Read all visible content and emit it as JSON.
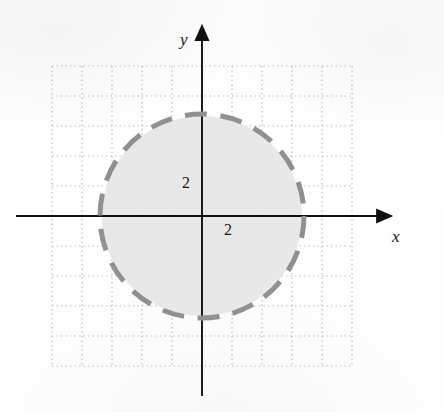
{
  "figure": {
    "background_color": "#fdfdfd"
  },
  "axes": {
    "x_label": "x",
    "y_label": "y",
    "axis_color": "#111111",
    "arrowheads": [
      "x-positive",
      "y-positive"
    ],
    "origin_px": {
      "x": 202,
      "y": 216
    }
  },
  "ticks": {
    "y_tick_label": "2",
    "x_tick_label": "2"
  },
  "grid": {
    "style": "dotted",
    "color": "#b9b9b9",
    "spacing_px": 30,
    "x_min_px": 52,
    "x_max_px": 352,
    "y_min_px": 66,
    "y_max_px": 366,
    "vertical_lines": 11,
    "horizontal_lines": 11
  },
  "chart_data": {
    "type": "scatter",
    "xlabel": "x",
    "ylabel": "y",
    "xlim": [
      -5,
      5
    ],
    "ylim": [
      -5,
      5
    ],
    "x_tick_labels": [
      "2"
    ],
    "y_tick_labels": [
      "2"
    ],
    "grid": true,
    "legend": "none",
    "annotations": [
      {
        "text": "2",
        "x": 0,
        "y": 2,
        "placement": "left-of-y-axis"
      },
      {
        "text": "2",
        "x": 2,
        "y": 0,
        "placement": "below-x-axis"
      }
    ],
    "series": [
      {
        "name": "boundary circle",
        "shape": "circle",
        "center": [
          0,
          0
        ],
        "radius": 2,
        "stroke": "#909090",
        "stroke_style": "dashed",
        "stroke_width_px": 5,
        "fill": "#e6e6e6",
        "fill_included": false,
        "center_px": [
          202,
          216
        ],
        "radius_px": 102
      }
    ]
  },
  "colors": {
    "circle_stroke": "#909090",
    "circle_fill": "#e6e6e6",
    "grid": "#b9b9b9",
    "axis": "#111111",
    "text": "#161616"
  }
}
